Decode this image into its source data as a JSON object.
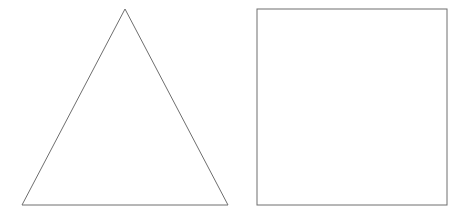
{
  "canvas": {
    "width": 466,
    "height": 214,
    "background_color": "#ffffff",
    "title": "Two geometric outline shapes"
  },
  "style": {
    "stroke_color": "#6e6e6e",
    "stroke_width": 1,
    "fill": "none"
  },
  "shapes": [
    {
      "name": "triangle",
      "label": "Triangle",
      "kind": "polygon",
      "sides": 3,
      "points": "125,9 228,205 22,205",
      "vertices": [
        {
          "x": 125,
          "y": 9
        },
        {
          "x": 228,
          "y": 205
        },
        {
          "x": 22,
          "y": 205
        }
      ],
      "stroke_color": "#6e6e6e",
      "stroke_width": 1,
      "fill": "none"
    },
    {
      "name": "square",
      "label": "Square",
      "kind": "rect",
      "sides": 4,
      "x": 257,
      "y": 9,
      "width": 190,
      "height": 196,
      "stroke_color": "#6e6e6e",
      "stroke_width": 1,
      "fill": "none"
    }
  ]
}
